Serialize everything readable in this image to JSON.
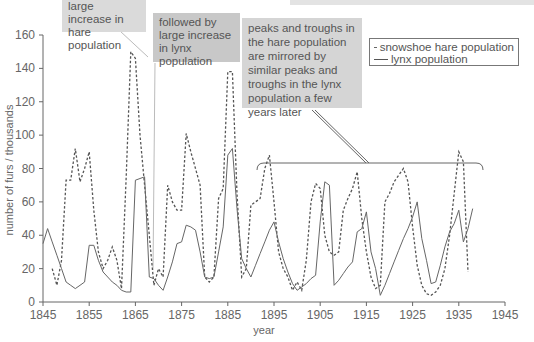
{
  "chart_data": {
    "type": "line",
    "title": "",
    "xlabel": "year",
    "ylabel": "number of furs / thousands",
    "xlim": [
      1845,
      1945
    ],
    "ylim": [
      0,
      160
    ],
    "x_ticks": [
      1845,
      1855,
      1865,
      1875,
      1885,
      1895,
      1905,
      1915,
      1925,
      1935,
      1945
    ],
    "y_ticks": [
      0,
      20,
      40,
      60,
      80,
      100,
      120,
      140,
      160
    ],
    "grid": false,
    "legend_position": "upper right",
    "series": [
      {
        "name": "snowshoe hare population",
        "style": "dashed",
        "color": "#555555",
        "x": [
          1847,
          1848,
          1849,
          1850,
          1851,
          1852,
          1853,
          1854,
          1855,
          1856,
          1857,
          1858,
          1859,
          1860,
          1861,
          1862,
          1863,
          1864,
          1865,
          1866,
          1867,
          1868,
          1869,
          1870,
          1871,
          1872,
          1873,
          1874,
          1875,
          1876,
          1877,
          1878,
          1879,
          1880,
          1881,
          1882,
          1883,
          1884,
          1885,
          1886,
          1887,
          1888,
          1889,
          1890,
          1891,
          1892,
          1893,
          1894,
          1895,
          1896,
          1897,
          1898,
          1899,
          1900,
          1901,
          1902,
          1903,
          1904,
          1905,
          1906,
          1907,
          1908,
          1909,
          1910,
          1911,
          1912,
          1913,
          1914,
          1915,
          1916,
          1917,
          1918,
          1919,
          1920,
          1921,
          1922,
          1923,
          1924,
          1925,
          1926,
          1927,
          1928,
          1929,
          1930,
          1931,
          1932,
          1933,
          1934,
          1935,
          1936,
          1937
        ],
        "values": [
          20,
          10,
          25,
          73,
          73,
          92,
          72,
          80,
          90,
          55,
          30,
          20,
          25,
          33,
          25,
          8,
          75,
          150,
          146,
          100,
          70,
          40,
          10,
          20,
          15,
          70,
          60,
          55,
          55,
          101,
          90,
          80,
          70,
          15,
          12,
          15,
          62,
          68,
          138,
          138,
          65,
          15,
          20,
          58,
          60,
          62,
          80,
          88,
          60,
          30,
          20,
          15,
          7,
          12,
          7,
          25,
          60,
          71,
          68,
          40,
          30,
          28,
          30,
          55,
          62,
          68,
          78,
          50,
          30,
          15,
          8,
          10,
          60,
          65,
          72,
          76,
          80,
          72,
          45,
          22,
          10,
          5,
          4,
          6,
          10,
          20,
          40,
          65,
          90,
          84,
          18
        ]
      },
      {
        "name": "lynx population",
        "style": "solid",
        "color": "#555555",
        "x": [
          1845,
          1846,
          1847,
          1848,
          1849,
          1850,
          1851,
          1852,
          1853,
          1854,
          1855,
          1856,
          1857,
          1858,
          1859,
          1860,
          1861,
          1862,
          1863,
          1864,
          1865,
          1866,
          1867,
          1868,
          1869,
          1870,
          1871,
          1872,
          1873,
          1874,
          1875,
          1876,
          1877,
          1878,
          1879,
          1880,
          1881,
          1882,
          1883,
          1884,
          1885,
          1886,
          1887,
          1888,
          1889,
          1890,
          1891,
          1892,
          1893,
          1894,
          1895,
          1896,
          1897,
          1898,
          1899,
          1900,
          1901,
          1902,
          1903,
          1904,
          1905,
          1906,
          1907,
          1908,
          1909,
          1910,
          1911,
          1912,
          1913,
          1914,
          1915,
          1916,
          1917,
          1918,
          1919,
          1920,
          1921,
          1922,
          1923,
          1924,
          1925,
          1926,
          1927,
          1928,
          1929,
          1930,
          1931,
          1932,
          1933,
          1934,
          1935,
          1936,
          1937,
          1938
        ],
        "values": [
          35,
          44,
          36,
          28,
          20,
          12,
          10,
          8,
          10,
          12,
          34,
          34,
          25,
          18,
          15,
          12,
          10,
          7,
          6,
          6,
          73,
          74,
          75,
          15,
          14,
          10,
          7,
          15,
          24,
          35,
          36,
          46,
          45,
          43,
          30,
          15,
          14,
          15,
          30,
          45,
          88,
          92,
          56,
          26,
          20,
          15,
          22,
          29,
          36,
          43,
          48,
          36,
          26,
          18,
          11,
          7,
          9,
          11,
          14,
          16,
          48,
          72,
          70,
          10,
          13,
          17,
          21,
          24,
          42,
          44,
          54,
          30,
          20,
          4,
          10,
          17,
          24,
          31,
          38,
          44,
          51,
          60,
          38,
          25,
          11,
          12,
          22,
          33,
          42,
          47,
          55,
          36,
          44,
          56
        ]
      }
    ],
    "annotations": [
      "large increase in hare population",
      "followed by large increase in lynx population",
      "peaks and troughs in the hare population are mirrored by similar peaks and troughs in the lynx population a few years later"
    ]
  },
  "callouts": {
    "hare_increase": "large increase in hare population",
    "lynx_increase": "followed by large increase in lynx population",
    "mirror": "peaks and troughs in the hare population are mirrored by similar peaks and troughs in the lynx population a few years later"
  },
  "legend": {
    "hare": "snowshoe hare population",
    "lynx": "lynx population"
  }
}
